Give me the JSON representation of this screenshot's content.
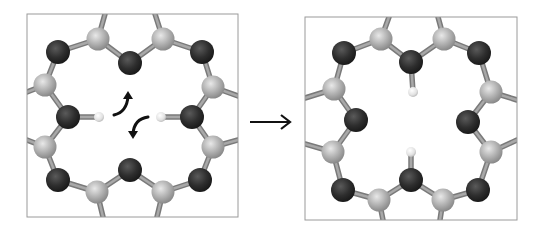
{
  "figure": {
    "colors": {
      "background": "#ffffff",
      "frame": "#9a9a9a",
      "bond": "#8e8e8e",
      "dark_atom": "#2e2e2e",
      "light_atom": "#b4b4b4",
      "hydrogen": "#e6e6e6",
      "arrow": "#111111"
    },
    "panels": [
      {
        "name": "before",
        "frame": {
          "x": 27,
          "y": 14,
          "w": 211,
          "h": 203
        },
        "dark_atoms": [
          [
            58,
            52
          ],
          [
            130,
            63
          ],
          [
            202,
            52
          ],
          [
            68,
            117
          ],
          [
            192,
            117
          ],
          [
            58,
            180
          ],
          [
            130,
            170
          ],
          [
            200,
            180
          ]
        ],
        "light_atoms": [
          [
            98,
            39
          ],
          [
            163,
            39
          ],
          [
            45,
            85
          ],
          [
            213,
            87
          ],
          [
            45,
            147
          ],
          [
            213,
            147
          ],
          [
            97,
            192
          ],
          [
            163,
            192
          ]
        ],
        "hydrogens": [
          [
            99,
            117
          ],
          [
            161,
            117
          ]
        ],
        "bonds": [
          [
            58,
            52,
            98,
            39
          ],
          [
            98,
            39,
            130,
            63
          ],
          [
            130,
            63,
            163,
            39
          ],
          [
            163,
            39,
            202,
            52
          ],
          [
            58,
            52,
            45,
            85
          ],
          [
            45,
            85,
            68,
            117
          ],
          [
            68,
            117,
            45,
            147
          ],
          [
            45,
            147,
            58,
            180
          ],
          [
            58,
            180,
            97,
            192
          ],
          [
            97,
            192,
            130,
            170
          ],
          [
            130,
            170,
            163,
            192
          ],
          [
            163,
            192,
            200,
            180
          ],
          [
            202,
            52,
            213,
            87
          ],
          [
            213,
            87,
            192,
            117
          ],
          [
            192,
            117,
            213,
            147
          ],
          [
            213,
            147,
            200,
            180
          ],
          [
            68,
            117,
            99,
            117
          ],
          [
            192,
            117,
            161,
            117
          ],
          [
            98,
            39,
            105,
            14
          ],
          [
            163,
            39,
            155,
            14
          ],
          [
            45,
            85,
            27,
            92
          ],
          [
            45,
            147,
            27,
            140
          ],
          [
            213,
            87,
            238,
            96
          ],
          [
            213,
            147,
            238,
            140
          ],
          [
            97,
            192,
            103,
            217
          ],
          [
            163,
            192,
            157,
            217
          ]
        ],
        "curved_arrows": [
          {
            "name": "upper-arrow",
            "path": "M114,115 Q127,112 128,96",
            "head": [
              128,
              91
            ]
          },
          {
            "name": "lower-arrow",
            "path": "M148,117 Q134,119 133,134",
            "head": [
              133,
              139
            ]
          }
        ]
      },
      {
        "name": "after",
        "frame": {
          "x": 305,
          "y": 17,
          "w": 212,
          "h": 203
        },
        "dark_atoms": [
          [
            344,
            53
          ],
          [
            411,
            62
          ],
          [
            479,
            53
          ],
          [
            356,
            120
          ],
          [
            468,
            122
          ],
          [
            343,
            190
          ],
          [
            411,
            180
          ],
          [
            478,
            190
          ]
        ],
        "light_atoms": [
          [
            381,
            39
          ],
          [
            444,
            39
          ],
          [
            334,
            89
          ],
          [
            491,
            92
          ],
          [
            333,
            152
          ],
          [
            491,
            152
          ],
          [
            379,
            200
          ],
          [
            443,
            200
          ]
        ],
        "hydrogens": [
          [
            413,
            92
          ],
          [
            411,
            152
          ]
        ],
        "bonds": [
          [
            344,
            53,
            381,
            39
          ],
          [
            381,
            39,
            411,
            62
          ],
          [
            411,
            62,
            444,
            39
          ],
          [
            444,
            39,
            479,
            53
          ],
          [
            344,
            53,
            334,
            89
          ],
          [
            334,
            89,
            356,
            120
          ],
          [
            356,
            120,
            333,
            152
          ],
          [
            333,
            152,
            343,
            190
          ],
          [
            343,
            190,
            379,
            200
          ],
          [
            379,
            200,
            411,
            180
          ],
          [
            411,
            180,
            443,
            200
          ],
          [
            443,
            200,
            478,
            190
          ],
          [
            479,
            53,
            491,
            92
          ],
          [
            491,
            92,
            468,
            122
          ],
          [
            468,
            122,
            491,
            152
          ],
          [
            491,
            152,
            478,
            190
          ],
          [
            411,
            62,
            413,
            92
          ],
          [
            411,
            180,
            411,
            152
          ],
          [
            381,
            39,
            389,
            17
          ],
          [
            444,
            39,
            438,
            17
          ],
          [
            334,
            89,
            305,
            98
          ],
          [
            333,
            152,
            305,
            144
          ],
          [
            491,
            92,
            517,
            100
          ],
          [
            491,
            152,
            517,
            140
          ],
          [
            379,
            200,
            383,
            220
          ],
          [
            443,
            200,
            440,
            220
          ]
        ]
      }
    ],
    "transition_arrow": {
      "x1": 250,
      "y1": 122,
      "x2": 290,
      "y2": 122
    }
  }
}
